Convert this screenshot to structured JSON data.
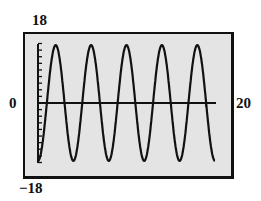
{
  "chart_data": {
    "type": "line",
    "title": "",
    "xlabel": "",
    "ylabel": "",
    "xlim": [
      0,
      20
    ],
    "ylim": [
      -18,
      18
    ],
    "grid": false,
    "legend": null,
    "tick_labels": {
      "x_min": "0",
      "x_max": "20",
      "y_max": "18",
      "y_min": "−18"
    },
    "y_tick_step": 2,
    "series": [
      {
        "name": "y = -17.5 cos(πx/2)",
        "function": "-17.5*cos(pi*x/2)",
        "amplitude": 17.5,
        "period": 4,
        "x": [
          0,
          2,
          4,
          6,
          8,
          10,
          12,
          14,
          16,
          18,
          20
        ],
        "values": [
          -17.5,
          17.5,
          -17.5,
          17.5,
          -17.5,
          17.5,
          -17.5,
          17.5,
          -17.5,
          17.5,
          -15
        ]
      }
    ],
    "colors": {
      "background": "#e4e4e4",
      "line": "#111111",
      "frame": "#111111"
    }
  }
}
